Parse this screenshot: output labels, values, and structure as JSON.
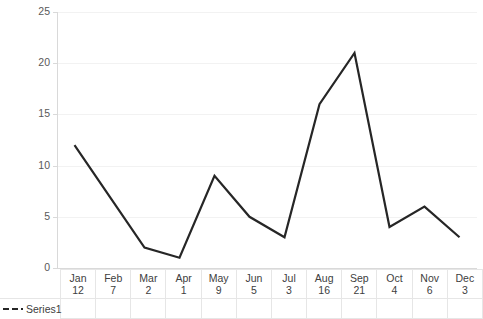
{
  "chart_data": {
    "type": "line",
    "title": "",
    "xlabel": "",
    "ylabel": "",
    "categories": [
      "Jan",
      "Feb",
      "Mar",
      "Apr",
      "May",
      "Jun",
      "Jul",
      "Aug",
      "Sep",
      "Oct",
      "Nov",
      "Dec"
    ],
    "values": [
      12,
      7,
      2,
      1,
      9,
      5,
      3,
      16,
      21,
      4,
      6,
      3
    ],
    "series": [
      {
        "name": "Series1",
        "values": [
          12,
          7,
          2,
          1,
          9,
          5,
          3,
          16,
          21,
          4,
          6,
          3
        ]
      }
    ],
    "ylim": [
      0,
      25
    ],
    "y_ticks": [
      0,
      5,
      10,
      15,
      20,
      25
    ],
    "y_tick_labels": [
      "0",
      "5",
      "10",
      "15",
      "20",
      "25"
    ],
    "grid": true,
    "legend_position": "bottom-left",
    "data_table_visible": true,
    "line_style": "solid",
    "line_color": "#262626",
    "legend_marker_style": "dashed"
  },
  "legend": {
    "series_label": "Series1"
  },
  "axis": {
    "y_labels": [
      "25",
      "20",
      "15",
      "10",
      "5",
      "0"
    ]
  },
  "table": {
    "categories": [
      "Jan",
      "Feb",
      "Mar",
      "Apr",
      "May",
      "Jun",
      "Jul",
      "Aug",
      "Sep",
      "Oct",
      "Nov",
      "Dec"
    ],
    "values": [
      "12",
      "7",
      "2",
      "1",
      "9",
      "5",
      "3",
      "16",
      "21",
      "4",
      "6",
      "3"
    ]
  },
  "colors": {
    "line": "#262626",
    "gridline": "#f2f2f2",
    "axis": "#d9d9d9",
    "text": "#404040",
    "tick_text": "#595959",
    "table_border": "#e6e6e6",
    "background": "#ffffff"
  }
}
